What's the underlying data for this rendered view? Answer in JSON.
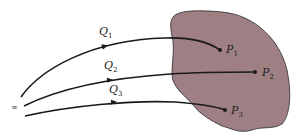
{
  "diagram": {
    "region_fill": "#9e7f84",
    "line_color": "#1a1a1a",
    "infinity_label": "∞",
    "paths": [
      {
        "label": "Q",
        "sub": "1"
      },
      {
        "label": "Q",
        "sub": "2"
      },
      {
        "label": "Q",
        "sub": "3"
      }
    ],
    "points": [
      {
        "label": "P",
        "sub": "1"
      },
      {
        "label": "P",
        "sub": "2"
      },
      {
        "label": "P",
        "sub": "3"
      }
    ]
  }
}
